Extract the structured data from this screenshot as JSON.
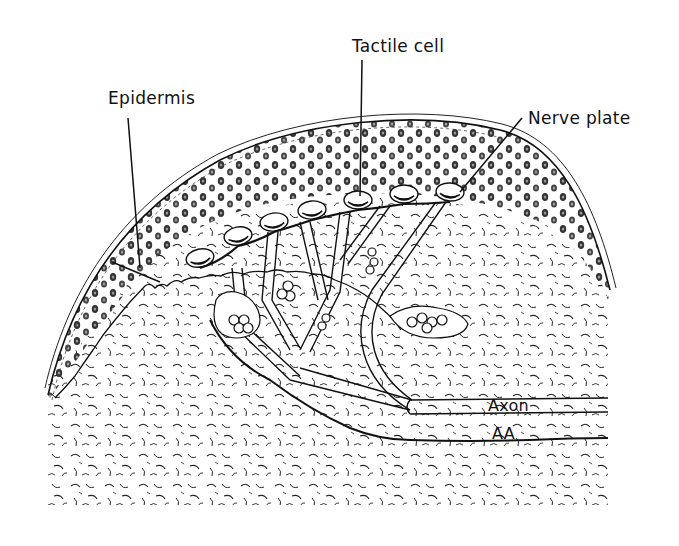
{
  "figure": {
    "labels": {
      "epidermis": "Epidermis",
      "tactile_cell": "Tactile cell",
      "nerve_plate": "Nerve plate",
      "axon": "Axon",
      "aa": "AA"
    },
    "colors": {
      "ink": "#111111",
      "background": "#ffffff"
    }
  }
}
